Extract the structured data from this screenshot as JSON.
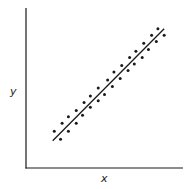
{
  "chart_data": {
    "type": "scatter",
    "title": "",
    "xlabel": "x",
    "ylabel": "y",
    "grid": false,
    "legend": null,
    "xlim": [
      0,
      100
    ],
    "ylim": [
      0,
      100
    ],
    "trend_line": {
      "x": [
        17,
        88
      ],
      "y": [
        17,
        87
      ]
    },
    "series": [
      {
        "name": "points",
        "x": [
          18,
          23,
          27,
          32,
          37,
          41,
          46,
          52,
          56,
          61,
          66,
          70,
          75,
          80,
          84,
          22,
          27,
          32,
          36,
          41,
          46,
          50,
          55,
          60,
          65,
          69,
          74,
          78,
          83,
          88
        ],
        "y": [
          23,
          28,
          32,
          36,
          41,
          45,
          50,
          55,
          60,
          64,
          69,
          73,
          78,
          83,
          87,
          18,
          23,
          28,
          33,
          38,
          42,
          46,
          51,
          56,
          61,
          65,
          69,
          74,
          79,
          83
        ]
      }
    ]
  },
  "axes": {
    "x_label": "x",
    "y_label": "y"
  },
  "colors": {
    "ink": "#1a1a1a",
    "background": "#ffffff"
  }
}
